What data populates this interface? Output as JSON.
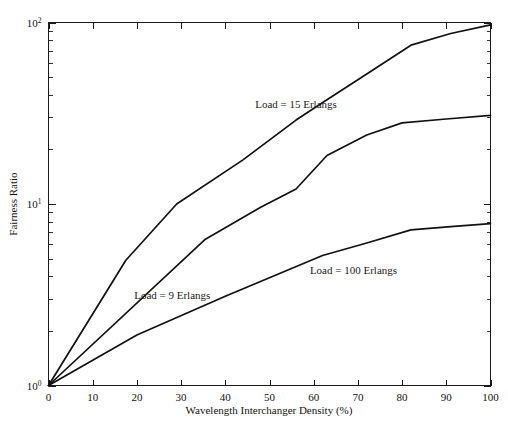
{
  "chart_data": {
    "type": "line",
    "title": "",
    "xlabel": "Wavelength Interchanger Density (%)",
    "ylabel": "Fairness Ratio",
    "xlim": [
      0,
      100
    ],
    "ylim": [
      1,
      100
    ],
    "yscale": "log",
    "xscale": "linear",
    "grid": false,
    "legend": "inline-annotations",
    "xticks": [
      0,
      10,
      20,
      30,
      40,
      50,
      60,
      70,
      80,
      90,
      100
    ],
    "xticklabels": [
      "0",
      "10",
      "20",
      "30",
      "40",
      "50",
      "60",
      "70",
      "80",
      "90",
      "100"
    ],
    "yticks": [
      1,
      10,
      100
    ],
    "yticklabels": [
      "10^0",
      "10^1",
      "10^2"
    ],
    "yticklabel_bases": [
      "10",
      "10",
      "10"
    ],
    "yticklabel_exponents": [
      "0",
      "1",
      "2"
    ],
    "yminorticks": [
      2,
      3,
      4,
      5,
      6,
      7,
      8,
      9,
      20,
      30,
      40,
      50,
      60,
      70,
      80,
      90
    ],
    "series": [
      {
        "name": "Load = 15 Erlangs",
        "label": "Load = 15 Erlangs",
        "label_x": 56,
        "label_y": 34,
        "x": [
          0,
          17.5,
          29,
          44,
          56,
          63,
          72,
          82,
          91,
          100
        ],
        "y": [
          1.0,
          4.9,
          10.0,
          17.5,
          29.0,
          37.5,
          52.0,
          75.0,
          87.0,
          97.0
        ]
      },
      {
        "name": "Load = 9 Erlangs",
        "label": "Load = 9 Erlangs",
        "label_x": 28,
        "label_y": 3.0,
        "x": [
          0,
          35.5,
          48,
          56,
          63,
          72,
          80,
          90,
          100
        ],
        "y": [
          1.0,
          6.4,
          9.6,
          12.1,
          18.5,
          24.0,
          28.0,
          29.4,
          30.8
        ]
      },
      {
        "name": "Load = 100 Erlangs",
        "label": "Load = 100 Erlangs",
        "label_x": 69,
        "label_y": 4.1,
        "x": [
          0,
          20,
          40,
          62,
          72,
          82,
          91,
          100
        ],
        "y": [
          1.0,
          1.9,
          3.1,
          5.2,
          6.1,
          7.2,
          7.5,
          7.8
        ]
      }
    ]
  },
  "figure": {
    "background_color": "#ffffff",
    "line_color": "#111111",
    "axis_color": "#1b1b1b"
  }
}
